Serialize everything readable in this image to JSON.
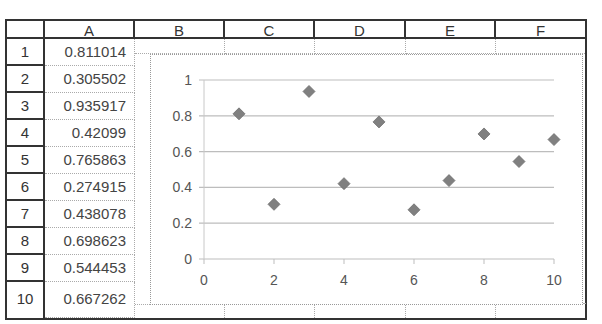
{
  "sheet": {
    "columns": [
      "A",
      "B",
      "C",
      "D",
      "E",
      "F"
    ],
    "rows": [
      "1",
      "2",
      "3",
      "4",
      "5",
      "6",
      "7",
      "8",
      "9",
      "10"
    ],
    "column_a_values": [
      "0.811014",
      "0.305502",
      "0.935917",
      "0.42099",
      "0.765863",
      "0.274915",
      "0.438078",
      "0.698623",
      "0.544453",
      "0.667262"
    ]
  },
  "chart_data": {
    "type": "scatter",
    "title": "",
    "xlabel": "",
    "ylabel": "",
    "x": [
      1,
      2,
      3,
      4,
      5,
      6,
      7,
      8,
      9,
      10
    ],
    "series": [
      {
        "name": "Column A",
        "values": [
          0.811014,
          0.305502,
          0.935917,
          0.42099,
          0.765863,
          0.274915,
          0.438078,
          0.698623,
          0.544453,
          0.667262
        ],
        "marker": "diamond",
        "color": "#808080"
      }
    ],
    "xlim": [
      0,
      10
    ],
    "ylim": [
      0,
      1
    ],
    "x_ticks": [
      "0",
      "2",
      "4",
      "6",
      "8",
      "10"
    ],
    "y_ticks": [
      "0",
      "0.2",
      "0.4",
      "0.6",
      "0.8",
      "1"
    ],
    "grid": "horizontal",
    "legend": "none"
  }
}
